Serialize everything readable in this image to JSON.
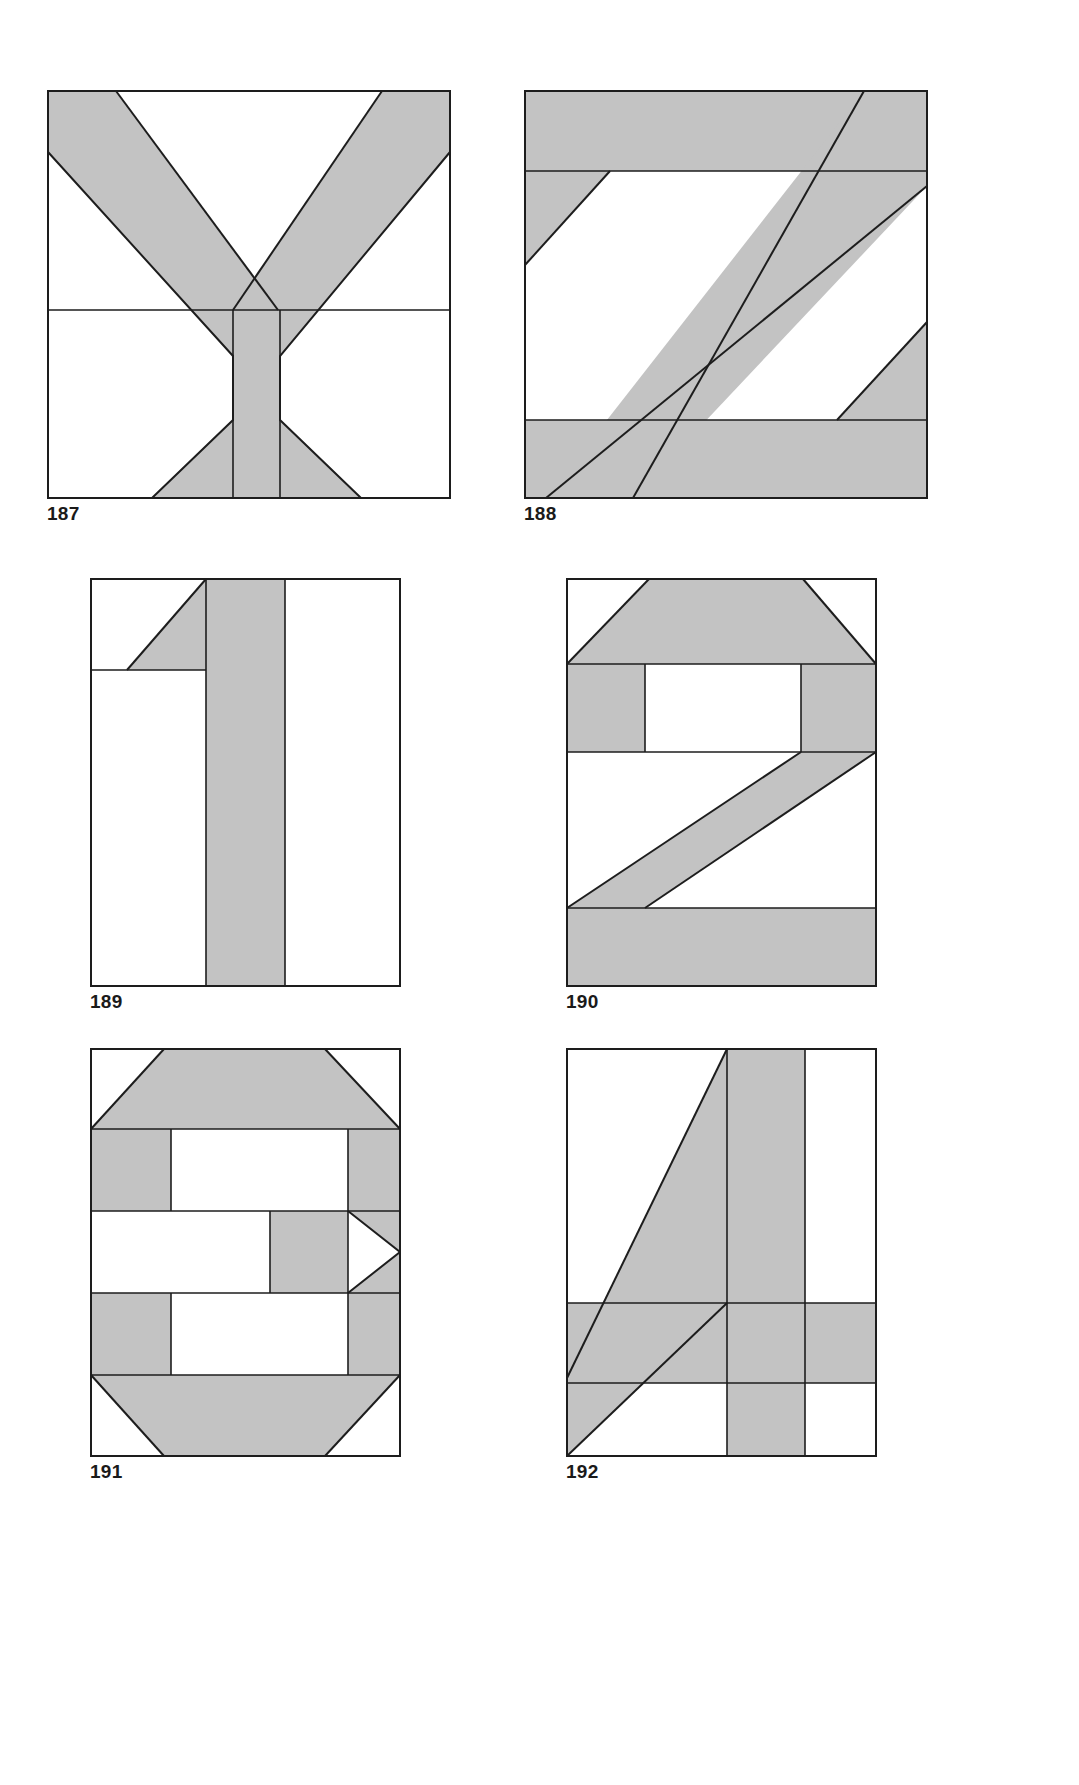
{
  "page": {
    "background_color": "#ffffff",
    "shade_color": "#c3c3c3",
    "line_color": "#1d1d1d",
    "figure_count": 6
  },
  "figures": [
    {
      "caption": "187",
      "glyph": "Y",
      "kind": "letter",
      "position": {
        "x": 47,
        "y": 90,
        "width": 404,
        "height": 409
      },
      "caption_position": {
        "x": 47,
        "y": 512
      },
      "piecing_seams": [
        "horizontal seam at mid-height across full block",
        "vertical seams at stem edges"
      ]
    },
    {
      "caption": "188",
      "glyph": "Z",
      "kind": "letter",
      "position": {
        "x": 524,
        "y": 90,
        "width": 404,
        "height": 409
      },
      "caption_position": {
        "x": 524,
        "y": 512
      },
      "piecing_seams": [
        "horizontal seam under top bar",
        "horizontal seam over bottom bar"
      ]
    },
    {
      "caption": "189",
      "glyph": "1",
      "kind": "numeral",
      "position": {
        "x": 90,
        "y": 578,
        "width": 311,
        "height": 409
      },
      "caption_position": {
        "x": 90,
        "y": 1000
      },
      "piecing_seams": [
        "horizontal seam below flag",
        "vertical seams at stem edges"
      ]
    },
    {
      "caption": "190",
      "glyph": "2",
      "kind": "numeral",
      "position": {
        "x": 566,
        "y": 578,
        "width": 311,
        "height": 409
      },
      "caption_position": {
        "x": 566,
        "y": 1000
      },
      "piecing_seams": [
        "horizontal seam below top bar",
        "horizontal seam below side bars",
        "horizontal seam above base bar"
      ]
    },
    {
      "caption": "191",
      "glyph": "3",
      "kind": "numeral",
      "position": {
        "x": 90,
        "y": 1048,
        "width": 311,
        "height": 409
      },
      "caption_position": {
        "x": 90,
        "y": 1470
      },
      "piecing_seams": [
        "horizontal seams between each pieced row"
      ]
    },
    {
      "caption": "192",
      "glyph": "4",
      "kind": "numeral",
      "position": {
        "x": 566,
        "y": 1048,
        "width": 311,
        "height": 409
      },
      "caption_position": {
        "x": 566,
        "y": 1470
      },
      "piecing_seams": [
        "horizontal seam at crossbar top",
        "horizontal seam at crossbar bottom",
        "vertical seams at stem edges"
      ]
    }
  ]
}
